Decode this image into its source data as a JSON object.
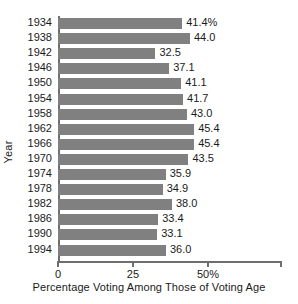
{
  "chart_data": {
    "type": "bar",
    "orientation": "horizontal",
    "title": "",
    "xlabel": "Percentage Voting Among Those of Voting Age",
    "ylabel": "Year",
    "categories": [
      "1934",
      "1938",
      "1942",
      "1946",
      "1950",
      "1954",
      "1958",
      "1962",
      "1966",
      "1970",
      "1974",
      "1978",
      "1982",
      "1986",
      "1990",
      "1994"
    ],
    "values": [
      41.4,
      44.0,
      32.5,
      37.1,
      41.1,
      41.7,
      43.0,
      45.4,
      45.4,
      43.5,
      35.9,
      34.9,
      38.0,
      33.4,
      33.1,
      36.0
    ],
    "value_labels": [
      "41.4%",
      "44.0",
      "32.5",
      "37.1",
      "41.1",
      "41.7",
      "43.0",
      "45.4",
      "45.4",
      "43.5",
      "35.9",
      "34.9",
      "38.0",
      "33.4",
      "33.1",
      "36.0"
    ],
    "xlim": [
      0,
      74.7
    ],
    "xticks": [
      0,
      25,
      50
    ],
    "xtick_labels": [
      "0",
      "25",
      "50%"
    ],
    "grid": false,
    "legend": null,
    "bar_color": "#808080",
    "axis_color": "#6e6e6e",
    "background": "#ffffff"
  }
}
